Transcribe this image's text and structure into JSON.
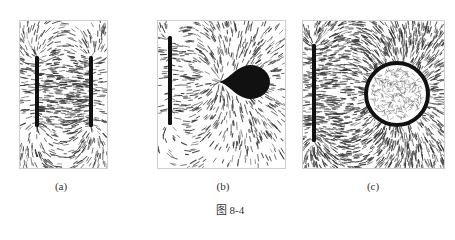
{
  "figure": {
    "caption": "图 8-4",
    "panels": [
      {
        "id": "a",
        "label": "(a)",
        "description": "Field lines between two parallel oppositely charged plates (grass-seed pattern)"
      },
      {
        "id": "b",
        "label": "(b)",
        "description": "Field lines between a charged plate and a teardrop-shaped conductor"
      },
      {
        "id": "c",
        "label": "(c)",
        "description": "Field lines between a charged plate and a conducting ring; no field inside ring"
      }
    ]
  },
  "colors": {
    "ink": "#111111",
    "fiber": "#333333",
    "frame": "#cfcfcf"
  }
}
